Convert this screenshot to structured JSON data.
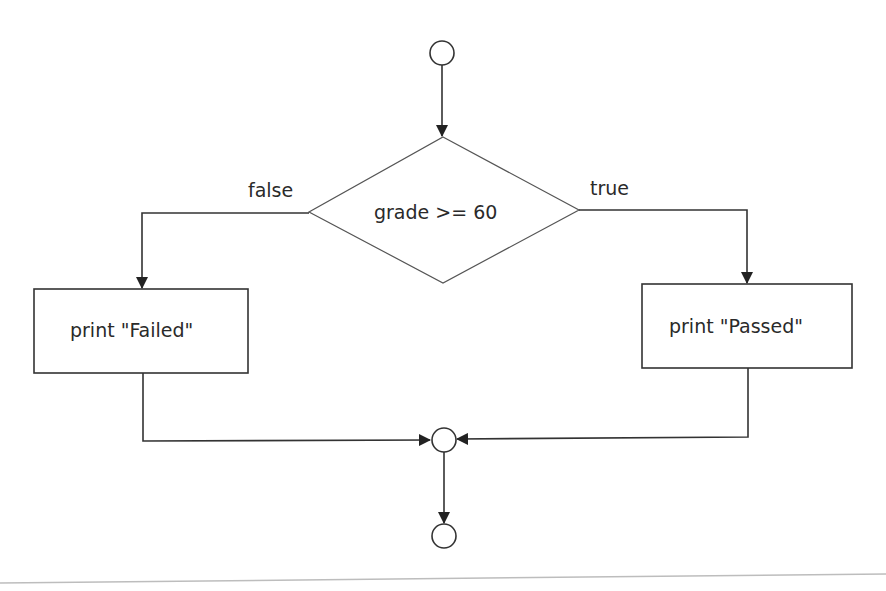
{
  "diagram": {
    "type": "flowchart",
    "title": "",
    "colors": {
      "stroke": "#333333",
      "background": "#ffffff",
      "text": "#2a2a2a",
      "baseline": "#bdbdbd"
    },
    "nodes": [
      {
        "id": "start",
        "shape": "circle",
        "label": ""
      },
      {
        "id": "decision",
        "shape": "diamond",
        "label": "grade >= 60"
      },
      {
        "id": "failed",
        "shape": "rectangle",
        "label": "print \"Failed\""
      },
      {
        "id": "passed",
        "shape": "rectangle",
        "label": "print \"Passed\""
      },
      {
        "id": "merge",
        "shape": "circle",
        "label": ""
      },
      {
        "id": "end",
        "shape": "circle",
        "label": ""
      }
    ],
    "edges": [
      {
        "from": "start",
        "to": "decision",
        "label": ""
      },
      {
        "from": "decision",
        "to": "failed",
        "label": "false"
      },
      {
        "from": "decision",
        "to": "passed",
        "label": "true"
      },
      {
        "from": "failed",
        "to": "merge",
        "label": ""
      },
      {
        "from": "passed",
        "to": "merge",
        "label": ""
      },
      {
        "from": "merge",
        "to": "end",
        "label": ""
      }
    ]
  },
  "labels": {
    "decision": "grade >= 60",
    "false_branch": "false",
    "true_branch": "true",
    "failed_box": "print \"Failed\"",
    "passed_box": "print \"Passed\""
  }
}
